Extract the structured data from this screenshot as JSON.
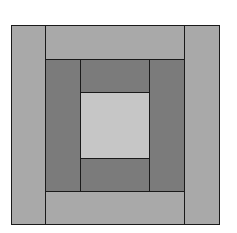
{
  "diagram": {
    "type": "log-cabin-quilt-block",
    "colors": {
      "outer": "#a9a9a9",
      "middle": "#7b7b7b",
      "center": "#c6c6c6",
      "line": "#1a1a1a",
      "background": "#ffffff"
    },
    "pieces": [
      {
        "name": "outer-left-strip",
        "x": 11,
        "y": 25,
        "w": 35,
        "h": 200,
        "ring": "outer"
      },
      {
        "name": "outer-right-strip",
        "x": 184,
        "y": 25,
        "w": 36,
        "h": 200,
        "ring": "outer"
      },
      {
        "name": "outer-top-strip",
        "x": 45,
        "y": 25,
        "w": 140,
        "h": 35,
        "ring": "outer"
      },
      {
        "name": "outer-bottom-strip",
        "x": 45,
        "y": 191,
        "w": 140,
        "h": 34,
        "ring": "outer"
      },
      {
        "name": "middle-left-strip",
        "x": 45,
        "y": 59,
        "w": 36,
        "h": 133,
        "ring": "middle"
      },
      {
        "name": "middle-right-strip",
        "x": 149,
        "y": 59,
        "w": 36,
        "h": 133,
        "ring": "middle"
      },
      {
        "name": "middle-top-strip",
        "x": 80,
        "y": 59,
        "w": 70,
        "h": 34,
        "ring": "middle"
      },
      {
        "name": "middle-bottom-strip",
        "x": 80,
        "y": 158,
        "w": 70,
        "h": 34,
        "ring": "middle"
      },
      {
        "name": "center-square",
        "x": 80,
        "y": 92,
        "w": 70,
        "h": 67,
        "ring": "center"
      }
    ]
  }
}
